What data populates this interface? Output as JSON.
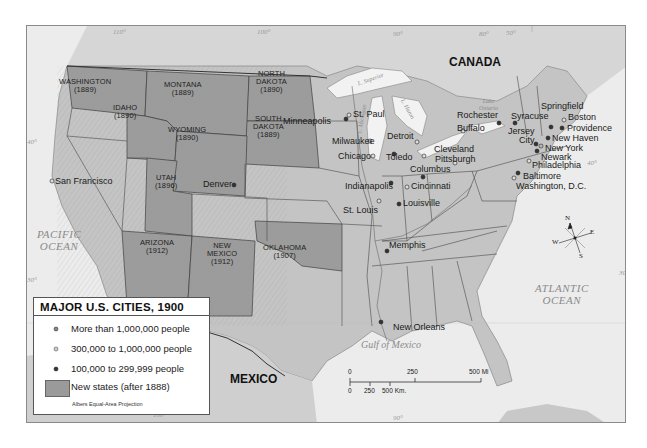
{
  "legend": {
    "title": "MAJOR U.S. CITIES, 1900",
    "items": [
      {
        "symbol": "large-city-dot",
        "label": "More than 1,000,000 people"
      },
      {
        "symbol": "medium-city-dot",
        "label": "300,000 to 1,000,000 people"
      },
      {
        "symbol": "small-city-dot",
        "label": "100,000 to 299,999 people"
      },
      {
        "symbol": "new-state-swatch",
        "label": "New states (after 1888)"
      }
    ],
    "projection": "Albers Equal-Area Projection"
  },
  "countries": {
    "canada": "CANADA",
    "mexico": "MEXICO"
  },
  "water": {
    "pacific": "PACIFIC\nOCEAN",
    "atlantic": "ATLANTIC\nOCEAN",
    "gulf": "Gulf of Mexico",
    "lake_superior": "L. Superior",
    "lake_michigan": "L. Michigan",
    "lake_huron": "L. Huron",
    "lake_ontario": "Lake\nOntario"
  },
  "new_states": [
    {
      "name": "WASHINGTON",
      "year": "(1889)"
    },
    {
      "name": "MONTANA",
      "year": "(1889)"
    },
    {
      "name": "NORTH\nDAKOTA",
      "year": "(1890)"
    },
    {
      "name": "SOUTH\nDAKOTA",
      "year": "(1889)"
    },
    {
      "name": "IDAHO",
      "year": "(1890)"
    },
    {
      "name": "WYOMING",
      "year": "(1890)"
    },
    {
      "name": "UTAH",
      "year": "(1896)"
    },
    {
      "name": "ARIZONA",
      "year": "(1912)"
    },
    {
      "name": "NEW\nMEXICO",
      "year": "(1912)"
    },
    {
      "name": "OKLAHOMA",
      "year": "(1907)"
    }
  ],
  "cities": [
    "San Francisco",
    "Denver",
    "Minneapolis",
    "St. Paul",
    "Milwaukee",
    "Chicago",
    "Detroit",
    "Toledo",
    "Cleveland",
    "Buffalo",
    "Rochester",
    "Syracuse",
    "Springfield",
    "Boston",
    "Providence",
    "New Haven",
    "New York",
    "Jersey\nCity",
    "Newark",
    "Philadelphia",
    "Baltimore",
    "Washington, D.C.",
    "Pittsburgh",
    "Columbus",
    "Cincinnati",
    "Indianapolis",
    "Louisville",
    "St. Louis",
    "Memphis",
    "New Orleans"
  ],
  "scale": {
    "mi": [
      "0",
      "250",
      "500 Mi"
    ],
    "km": [
      "0",
      "250",
      "500 Km."
    ]
  },
  "compass": {
    "n": "N",
    "s": "S",
    "e": "E",
    "w": "W"
  },
  "graticule": {
    "lon_110": "110°",
    "lon_100": "100°",
    "lon_90": "90°",
    "lon_80": "80°",
    "lon_50": "50°",
    "lat_40_w": "40°",
    "lat_30_w": "30°",
    "lat_40_e": "40°",
    "lat_30_e": "30°",
    "lon_90_bottom": "90°",
    "lon_100_bottom": "100°"
  },
  "colors": {
    "new_state_fill": "#9a9a9a",
    "land": "#c8c8c8",
    "water": "#ececec",
    "border": "#3a3a3a"
  }
}
